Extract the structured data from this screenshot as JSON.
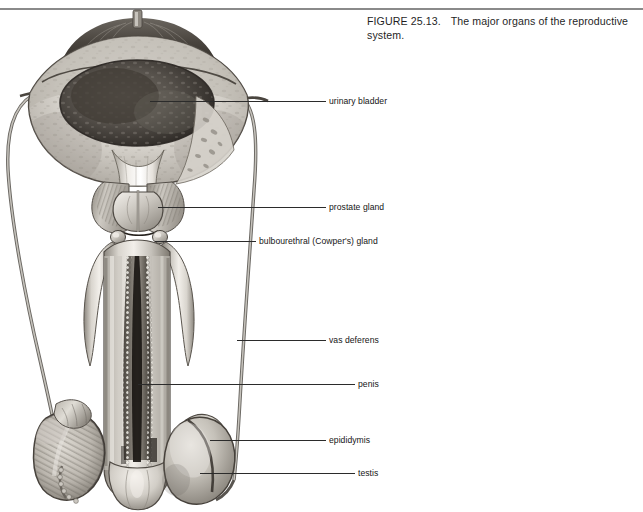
{
  "figure": {
    "number": "FIGURE 25.13.",
    "caption": "The major organs of the reproductive system.",
    "background_color": "#ffffff",
    "rule_color": "#8a8a8a",
    "text_color": "#1f1f1f",
    "leader_color": "#2b2b2b"
  },
  "labels": [
    {
      "id": "urinary-bladder",
      "text": "urinary bladder"
    },
    {
      "id": "prostate-gland",
      "text": "prostate gland"
    },
    {
      "id": "bulbourethral",
      "text": "bulbourethral (Cowper's) gland"
    },
    {
      "id": "vas-deferens",
      "text": "vas deferens"
    },
    {
      "id": "penis",
      "text": "penis"
    },
    {
      "id": "epididymis",
      "text": "epididymis"
    },
    {
      "id": "testis",
      "text": "testis"
    }
  ],
  "illustration": {
    "title": "male-reproductive-system-anatomical-drawing",
    "style": "grayscale pencil/wash medical illustration, anterior view, bladder and penis shown in cut-away section",
    "structures": [
      "urinary bladder (opened, showing interior mucosa and urachus stub at dome)",
      "ureters (entering bladder at both sides)",
      "seminal vesicles (flanking prostate, ridged texture)",
      "prostate gland",
      "bulbourethral (Cowper's) glands (paired, small, below prostate)",
      "vas deferens (left and right, looping laterally)",
      "penis shaft with corpora and urethra in longitudinal section",
      "glans penis",
      "left testis in sagittal section showing lobules",
      "right testis with epididymis draped over it"
    ]
  }
}
